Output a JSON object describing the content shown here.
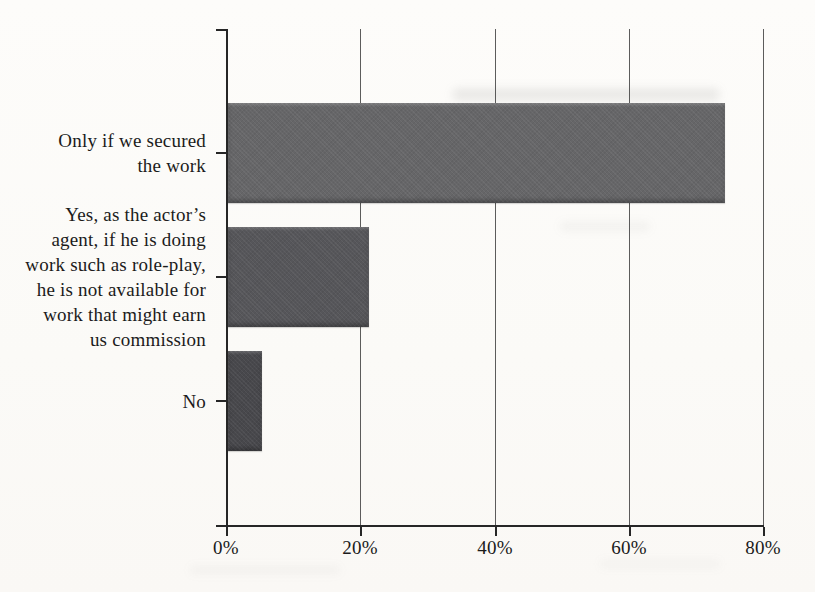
{
  "chart_data": {
    "type": "bar",
    "orientation": "horizontal",
    "title": "",
    "xlabel": "",
    "ylabel": "",
    "categories": [
      "Only if we secured\nthe work",
      "Yes, as the actor’s\nagent, if he is doing\nwork such as role-play,\nhe is not available for\nwork that might earn\nus commission",
      "No"
    ],
    "values": [
      74,
      21,
      5
    ],
    "unit": "%",
    "xlim": [
      0,
      80
    ],
    "x_tick_labels": [
      "0%",
      "20%",
      "40%",
      "60%",
      "80%"
    ],
    "x_tick_values": [
      0,
      20,
      40,
      60,
      80
    ],
    "grid": true,
    "legend": false,
    "bar_colors": [
      "#666668",
      "#56565a",
      "#48484c"
    ],
    "axis_color": "#262626",
    "gridline_color": "#3f3f3f",
    "text_color": "#1b1b1b",
    "background_color": "#fcfbf8"
  }
}
